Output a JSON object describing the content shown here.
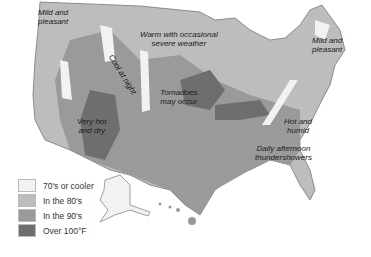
{
  "map": {
    "title": "US summer weather map",
    "colors": {
      "cool": "#f2f2f2",
      "eighties": "#bdbdbd",
      "nineties": "#9a9a9a",
      "over100": "#6e6e6e"
    }
  },
  "annotations": [
    {
      "id": "nw",
      "text": "Mild and\npleasant"
    },
    {
      "id": "central-north",
      "text": "Warm with occasional\nsevere weather"
    },
    {
      "id": "ne",
      "text": "Mild and\npleasant"
    },
    {
      "id": "rockies",
      "text": "Cool at night"
    },
    {
      "id": "plains",
      "text": "Tornadoes\nmay occur"
    },
    {
      "id": "southwest",
      "text": "Very hot\nand dry"
    },
    {
      "id": "southeast",
      "text": "Hot and\nhumid"
    },
    {
      "id": "gulf",
      "text": "Daily afternoon\nthundershowers"
    }
  ],
  "legend": [
    {
      "label": "70's or cooler",
      "color": "#f2f2f2"
    },
    {
      "label": "In the 80's",
      "color": "#bdbdbd"
    },
    {
      "label": "In the 90's",
      "color": "#9a9a9a"
    },
    {
      "label": "Over 100°F",
      "color": "#6e6e6e"
    }
  ]
}
